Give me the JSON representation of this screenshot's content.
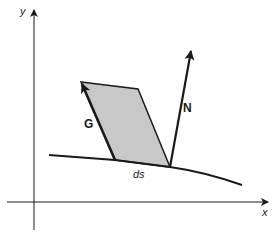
{
  "diagram": {
    "type": "vector-geometry",
    "colors": {
      "stroke": "#1a1a1a",
      "fill": "#c8c8c8",
      "background": "#ffffff"
    },
    "axes": {
      "x_label": "x",
      "y_label": "y"
    },
    "labels": {
      "G": "G",
      "N": "N",
      "ds": "ds"
    }
  }
}
